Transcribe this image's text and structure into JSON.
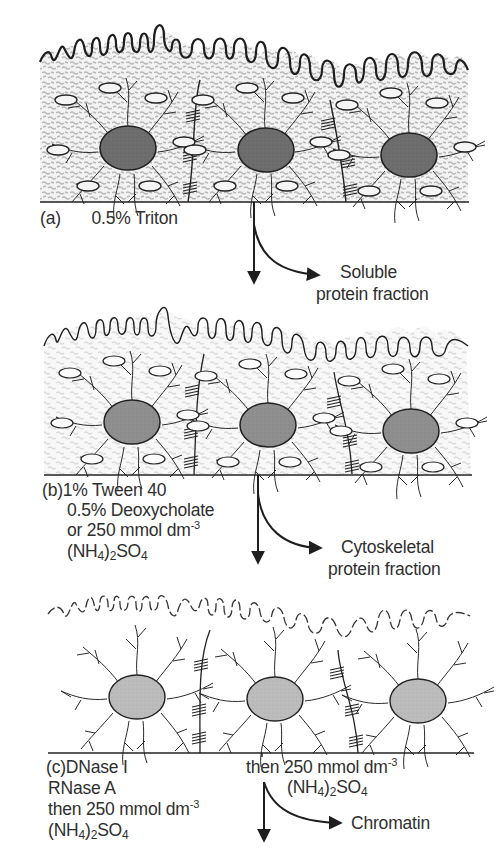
{
  "figure": {
    "panels": [
      {
        "id": "a",
        "label": "(a)",
        "treatment_lines": [
          "0.5% Triton"
        ],
        "extracted_fraction": [
          "Soluble",
          "protein fraction"
        ],
        "state": "intact cells: membrane, cytoplasmic texture, vesicles, cytoskeleton, nuclei, junctions"
      },
      {
        "id": "b",
        "label": "(b)",
        "treatment_lines": [
          "1% Tween 40",
          "0.5% Deoxycholate",
          "or 250 mmol dm",
          "(NH",
          ")",
          "SO"
        ],
        "extracted_fraction": [
          "Cytoskeletal",
          "protein fraction"
        ],
        "state": "lighter texture, vesicles, cytoskeleton, nuclei, junctions"
      },
      {
        "id": "c",
        "label": "(c)",
        "treatment_lines": [
          "DNase I",
          "RNase A",
          "then 250 mmol dm",
          "(NH",
          ")",
          "SO"
        ],
        "side_treatment": [
          "then 250 mmol dm",
          "(NH",
          ")",
          "SO"
        ],
        "extracted_fraction": [
          "Chromatin"
        ],
        "state": "dashed membrane remnants, cytoskeleton, nuclei, junctions"
      }
    ],
    "units": {
      "exponent": "-3",
      "sub4": "4",
      "sub2": "2"
    },
    "colors": {
      "line": "#222222",
      "nucleus_dark": "#6b6b6b",
      "nucleus_light": "#b5b5b5",
      "texture_a": "#bdbdbd",
      "texture_b": "#d6d6d6"
    }
  }
}
